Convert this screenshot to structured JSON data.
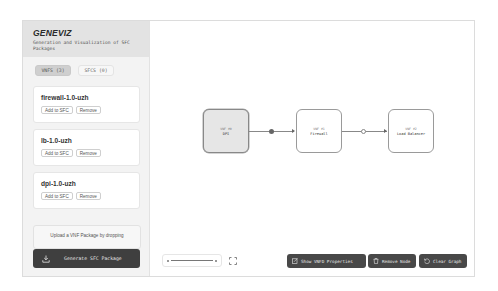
{
  "app": {
    "title": "GENEVIZ",
    "subtitle": "Generation and Visualization of SFC Packages"
  },
  "tabs": [
    {
      "label": "VNFS (3)",
      "active": true
    },
    {
      "label": "SFCS (0)",
      "active": false
    }
  ],
  "vnfs": [
    {
      "name": "firewall-1.0-uzh",
      "add_label": "Add to SFC",
      "remove_label": "Remove"
    },
    {
      "name": "lb-1.0-uzh",
      "add_label": "Add to SFC",
      "remove_label": "Remove"
    },
    {
      "name": "dpi-1.0-uzh",
      "add_label": "Add to SFC",
      "remove_label": "Remove"
    }
  ],
  "upload": {
    "text": "Upload a VNF Package by dropping"
  },
  "generate_button": {
    "label": "Generate SFC Package",
    "icon": "download-icon"
  },
  "graph": {
    "nodes": [
      {
        "id_label": "VNF #0",
        "name": "DPI",
        "selected": true
      },
      {
        "id_label": "VNF #1",
        "name": "Firewall",
        "selected": false
      },
      {
        "id_label": "VNF #2",
        "name": "Load Balancer",
        "selected": false
      }
    ],
    "edges": [
      {
        "from": "VNF #0",
        "to": "VNF #1",
        "marker": "filled"
      },
      {
        "from": "VNF #1",
        "to": "VNF #2",
        "marker": "hollow"
      }
    ]
  },
  "toolbar": {
    "show_props_label": "Show VNFD Properties",
    "remove_node_label": "Remove Node",
    "clear_graph_label": "Clear Graph"
  },
  "colors": {
    "primary_dark": "#3f3f3f",
    "sidebar_bg": "#f3f3f3",
    "header_bg": "#e3e3e3"
  }
}
